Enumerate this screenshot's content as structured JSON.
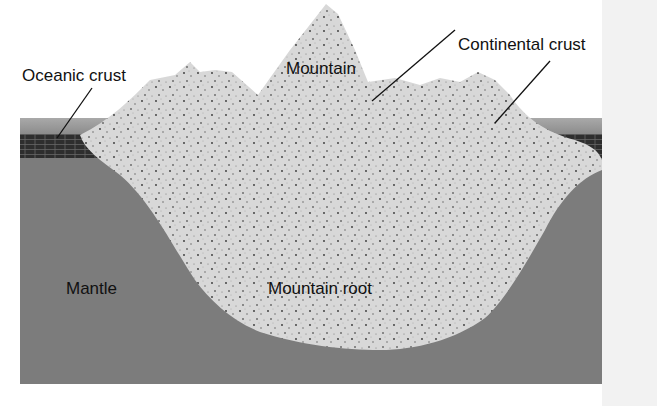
{
  "labels": {
    "oceanic_crust": "Oceanic crust",
    "continental_crust": "Continental crust",
    "mountain": "Mountain",
    "mantle": "Mantle",
    "mountain_root": "Mountain root"
  },
  "colors": {
    "mantle": "#7a7a7a",
    "ocean": "#9a9a9a",
    "crust": "#d9d9d9",
    "oceanic_crust": "#3a3a3a",
    "background": "#ffffff"
  }
}
